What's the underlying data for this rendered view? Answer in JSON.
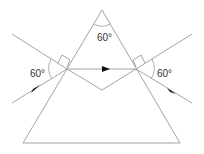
{
  "diagram": {
    "type": "prism refraction",
    "labels": {
      "apex_angle": "60°",
      "incidence_angle": "60°",
      "emergence_angle": "60°"
    },
    "colors": {
      "lines": "#9a9a9a",
      "arrows": "#111111",
      "text": "#333333"
    }
  }
}
